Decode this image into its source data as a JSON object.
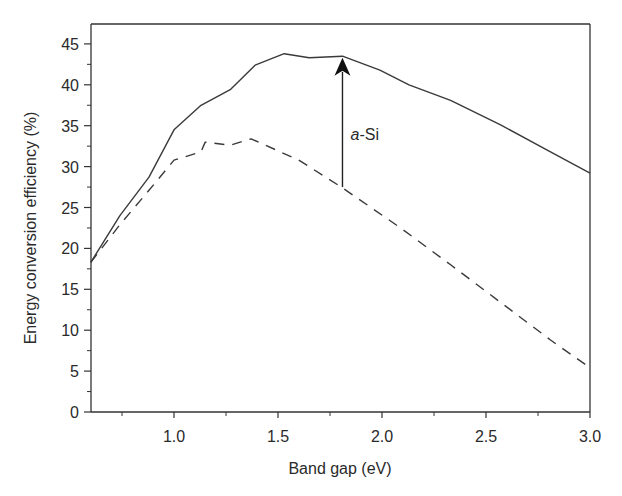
{
  "chart_data": {
    "type": "line",
    "title": "",
    "xlabel": "Band gap (eV)",
    "ylabel": "Energy conversion efficiency (%)",
    "xlim": [
      0.6,
      3.0
    ],
    "ylim": [
      0,
      47
    ],
    "x_ticks": [
      "1.0",
      "1.5",
      "2.0",
      "2.5",
      "3.0"
    ],
    "x_tick_values": [
      1.0,
      1.5,
      2.0,
      2.5,
      3.0
    ],
    "x_minor_ticks": [
      0.75,
      1.25,
      1.75,
      2.25,
      2.75
    ],
    "y_ticks": [
      "0",
      "5",
      "10",
      "15",
      "20",
      "25",
      "30",
      "35",
      "40",
      "45"
    ],
    "y_tick_values": [
      0,
      5,
      10,
      15,
      20,
      25,
      30,
      35,
      40,
      45
    ],
    "grid": false,
    "legend": null,
    "series": [
      {
        "name": "upper limit (solid)",
        "style": "solid",
        "x": [
          0.6,
          0.74,
          0.88,
          1.0,
          1.13,
          1.27,
          1.39,
          1.53,
          1.65,
          1.81,
          1.99,
          2.13,
          2.33,
          2.57,
          2.81,
          3.0
        ],
        "y": [
          18.3,
          24.0,
          28.7,
          34.5,
          37.5,
          39.4,
          42.4,
          43.8,
          43.3,
          43.5,
          41.8,
          40.0,
          38.1,
          35.1,
          31.8,
          29.2
        ]
      },
      {
        "name": "lower curve (dashed)",
        "style": "dashed",
        "x": [
          0.6,
          0.74,
          0.88,
          1.0,
          1.13,
          1.15,
          1.27,
          1.37,
          1.6,
          1.81,
          2.09,
          2.33,
          2.57,
          2.81,
          3.0
        ],
        "y": [
          18.3,
          22.9,
          27.1,
          30.8,
          31.8,
          33.0,
          32.6,
          33.4,
          30.8,
          27.4,
          22.5,
          18.0,
          13.4,
          8.8,
          5.4
        ]
      }
    ],
    "annotations": [
      {
        "type": "arrow",
        "label_italic": "a",
        "label_rest": "-Si",
        "x": 1.81,
        "y_from": 27.5,
        "y_to": 43.3
      }
    ]
  }
}
